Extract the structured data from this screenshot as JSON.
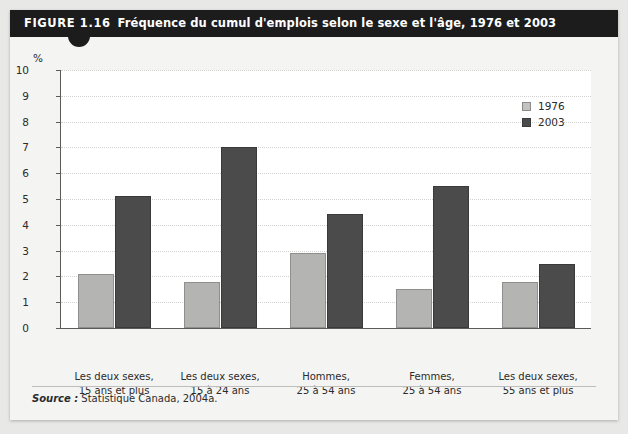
{
  "figure": {
    "number": "FIGURE 1.16",
    "caption": "Fréquence du cumul d'emplois selon le sexe et l'âge, 1976 et 2003",
    "axis_unit": "%",
    "source_label": "Source :",
    "source_text": "Statistique Canada, 2004a."
  },
  "colors": {
    "title_bar": "#1c1c1c",
    "series_1976": "#b4b4b2",
    "series_2003": "#4b4b4b",
    "plot_background": "#ffffff",
    "page_background": "#f4f4f2",
    "gridline": "#d2d2d2",
    "axis": "#5a5a5a"
  },
  "chart_data": {
    "type": "bar",
    "title": "Fréquence du cumul d'emplois selon le sexe et l'âge, 1976 et 2003",
    "xlabel": "",
    "ylabel": "%",
    "ylim": [
      0,
      10
    ],
    "yticks": [
      0,
      1,
      2,
      3,
      4,
      5,
      6,
      7,
      8,
      9,
      10
    ],
    "ytick_labels": [
      "0",
      "1",
      "2",
      "3",
      "4",
      "5",
      "6",
      "7",
      "8",
      "9",
      "10"
    ],
    "grid": true,
    "legend_position": "top-right",
    "categories": [
      "Les deux sexes, 15 ans et plus",
      "Les deux sexes, 15 à 24 ans",
      "Hommes, 25 à 54 ans",
      "Femmes, 25 à 54 ans",
      "Les deux sexes, 55 ans et plus"
    ],
    "category_lines": [
      [
        "Les deux sexes,",
        "15 ans et plus"
      ],
      [
        "Les deux sexes,",
        "15 à 24 ans"
      ],
      [
        "Hommes,",
        "25 à 54 ans"
      ],
      [
        "Femmes,",
        "25 à 54 ans"
      ],
      [
        "Les deux sexes,",
        "55 ans et plus"
      ]
    ],
    "series": [
      {
        "name": "1976",
        "color": "#b4b4b2",
        "values": [
          2.1,
          1.8,
          2.9,
          1.5,
          1.8
        ]
      },
      {
        "name": "2003",
        "color": "#4b4b4b",
        "values": [
          5.1,
          7.0,
          4.4,
          5.5,
          2.5
        ]
      }
    ]
  }
}
